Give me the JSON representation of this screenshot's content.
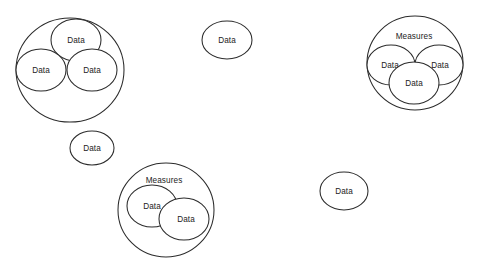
{
  "diagram": {
    "type": "venn-cluster-diagram",
    "background_color": "#ffffff",
    "stroke_color": "#2b2b2b",
    "text_color": "#1c1c1c",
    "labels": {
      "data": "Data",
      "measures": "Measures"
    },
    "clusters": [
      {
        "id": "cluster-left",
        "label": "",
        "outer": {
          "cx": 70,
          "cy": 70,
          "rx": 54,
          "ry": 52
        },
        "children": [
          {
            "label": "Data",
            "cx": 76,
            "cy": 40,
            "rx": 25,
            "ry": 21
          },
          {
            "label": "Data",
            "cx": 41,
            "cy": 70,
            "rx": 25,
            "ry": 21
          },
          {
            "label": "Data",
            "cx": 92,
            "cy": 70,
            "rx": 25,
            "ry": 21
          }
        ]
      },
      {
        "id": "cluster-bottom-center",
        "label": "Measures",
        "label_x": 164,
        "label_y": 181,
        "outer": {
          "cx": 166,
          "cy": 210,
          "rx": 48,
          "ry": 47
        },
        "children": [
          {
            "label": "Data",
            "cx": 152,
            "cy": 206,
            "rx": 25,
            "ry": 21
          },
          {
            "label": "Data",
            "cx": 184,
            "cy": 219,
            "rx": 25,
            "ry": 21
          }
        ]
      },
      {
        "id": "cluster-right",
        "label": "Measures",
        "label_x": 414,
        "label_y": 37,
        "outer": {
          "cx": 415,
          "cy": 63,
          "rx": 48,
          "ry": 47
        },
        "children": [
          {
            "label": "Data",
            "cx": 391,
            "cy": 65,
            "rx": 24,
            "ry": 20
          },
          {
            "label": "Data",
            "cx": 439,
            "cy": 65,
            "rx": 24,
            "ry": 20
          },
          {
            "label": "Data",
            "cx": 414,
            "cy": 83,
            "rx": 25,
            "ry": 21
          }
        ]
      }
    ],
    "standalone": [
      {
        "id": "node-top-center",
        "label": "Data",
        "cx": 227,
        "cy": 40,
        "rx": 25,
        "ry": 19
      },
      {
        "id": "node-mid-left",
        "label": "Data",
        "cx": 92,
        "cy": 148,
        "rx": 22,
        "ry": 17
      },
      {
        "id": "node-bottom-right",
        "label": "Data",
        "cx": 344,
        "cy": 191,
        "rx": 24,
        "ry": 19
      }
    ]
  }
}
